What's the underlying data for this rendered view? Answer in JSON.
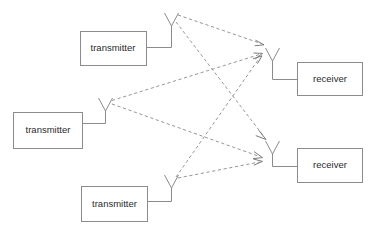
{
  "diagram": {
    "canvas": {
      "width": 372,
      "height": 231,
      "background": "#ffffff"
    },
    "colors": {
      "box_stroke": "#8c8c8c",
      "box_fill": "#ffffff",
      "text": "#2b2b2b",
      "antenna_stroke": "#8c8c8c",
      "link_stroke": "#8a8a8a",
      "arrow_stroke": "#6e6e6e"
    },
    "transmitters": [
      {
        "id": "tx1",
        "label": "transmitter",
        "box": {
          "x": 80,
          "y": 31,
          "width": 66,
          "height": 34
        },
        "label_pos": {
          "x": 113,
          "y": 48
        },
        "antenna": {
          "x": 171,
          "y_top": 13,
          "y_base": 47,
          "spread": 7,
          "arm_height": 13
        },
        "lead": {
          "from_x": 146,
          "to_x": 171,
          "y": 47
        }
      },
      {
        "id": "tx2",
        "label": "transmitter",
        "box": {
          "x": 13,
          "y": 112,
          "width": 69,
          "height": 36
        },
        "label_pos": {
          "x": 47.5,
          "y": 130
        },
        "antenna": {
          "x": 105,
          "y_top": 98,
          "y_base": 123,
          "spread": 7,
          "arm_height": 13
        },
        "lead": {
          "from_x": 82,
          "to_x": 105,
          "y": 123
        }
      },
      {
        "id": "tx3",
        "label": "transmitter",
        "box": {
          "x": 81,
          "y": 186,
          "width": 66,
          "height": 35
        },
        "label_pos": {
          "x": 114,
          "y": 203.5
        },
        "antenna": {
          "x": 171,
          "y_top": 175,
          "y_base": 201,
          "spread": 7,
          "arm_height": 13
        },
        "lead": {
          "from_x": 147,
          "to_x": 171,
          "y": 201
        }
      }
    ],
    "receivers": [
      {
        "id": "rx1",
        "label": "receiver",
        "box": {
          "x": 297,
          "y": 62,
          "width": 65,
          "height": 33
        },
        "label_pos": {
          "x": 329.5,
          "y": 78.5
        },
        "antenna": {
          "x": 272,
          "y_top": 48,
          "y_base": 79,
          "spread": 7,
          "arm_height": 13
        },
        "lead": {
          "from_x": 272,
          "to_x": 297,
          "y": 79
        }
      },
      {
        "id": "rx2",
        "label": "receiver",
        "box": {
          "x": 297,
          "y": 148,
          "width": 65,
          "height": 34
        },
        "label_pos": {
          "x": 329.5,
          "y": 165
        },
        "antenna": {
          "x": 272,
          "y_top": 141,
          "y_base": 166,
          "spread": 7,
          "arm_height": 13
        },
        "lead": {
          "from_x": 272,
          "to_x": 297,
          "y": 166
        }
      }
    ],
    "links": [
      {
        "id": "tx1-rx1",
        "from": "tx1",
        "to": "rx1",
        "x1": 178,
        "y1": 15,
        "x2": 264,
        "y2": 44
      },
      {
        "id": "tx1-rx2",
        "from": "tx1",
        "to": "rx2",
        "x1": 176,
        "y1": 22,
        "x2": 266,
        "y2": 139
      },
      {
        "id": "tx2-rx1",
        "from": "tx2",
        "to": "rx1",
        "x1": 112,
        "y1": 100,
        "x2": 262,
        "y2": 53
      },
      {
        "id": "tx2-rx2",
        "from": "tx2",
        "to": "rx2",
        "x1": 112,
        "y1": 104,
        "x2": 262,
        "y2": 158
      },
      {
        "id": "tx3-rx1",
        "from": "tx3",
        "to": "rx1",
        "x1": 176,
        "y1": 177,
        "x2": 262,
        "y2": 56
      },
      {
        "id": "tx3-rx2",
        "from": "tx3",
        "to": "rx2",
        "x1": 178,
        "y1": 178,
        "x2": 262,
        "y2": 161
      }
    ]
  }
}
